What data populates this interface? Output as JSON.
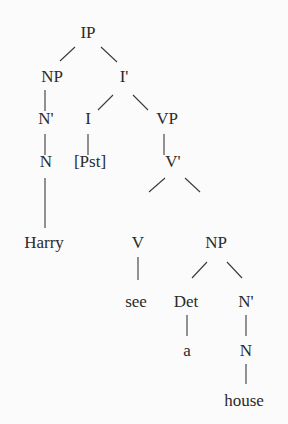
{
  "nodes": {
    "ip": {
      "label": "IP",
      "x": 88,
      "y": 38
    },
    "np1": {
      "label": "NP",
      "x": 52,
      "y": 82
    },
    "ibar": {
      "label": "I'",
      "x": 124,
      "y": 82
    },
    "nbar1": {
      "label": "N'",
      "x": 46,
      "y": 124
    },
    "i": {
      "label": "I",
      "x": 88,
      "y": 124
    },
    "vp": {
      "label": "VP",
      "x": 167,
      "y": 124
    },
    "n1": {
      "label": "N",
      "x": 46,
      "y": 167
    },
    "pst": {
      "label": "[Pst]",
      "x": 90,
      "y": 167
    },
    "vbar": {
      "label": "V'",
      "x": 173,
      "y": 167
    },
    "harry": {
      "label": "Harry",
      "x": 44,
      "y": 248
    },
    "v": {
      "label": "V",
      "x": 138,
      "y": 248
    },
    "np2": {
      "label": "NP",
      "x": 216,
      "y": 248
    },
    "see": {
      "label": "see",
      "x": 136,
      "y": 307
    },
    "det": {
      "label": "Det",
      "x": 186,
      "y": 307
    },
    "nbar2": {
      "label": "N'",
      "x": 246,
      "y": 307
    },
    "a": {
      "label": "a",
      "x": 187,
      "y": 356
    },
    "n2": {
      "label": "N",
      "x": 246,
      "y": 356
    },
    "house": {
      "label": "house",
      "x": 244,
      "y": 406
    }
  },
  "edges": [
    [
      "ip",
      "np1"
    ],
    [
      "ip",
      "ibar"
    ],
    [
      "np1",
      "nbar1"
    ],
    [
      "ibar",
      "i"
    ],
    [
      "ibar",
      "vp"
    ],
    [
      "nbar1",
      "n1"
    ],
    [
      "i",
      "pst"
    ],
    [
      "vp",
      "vbar"
    ],
    [
      "n1",
      "harry"
    ],
    [
      "vbar",
      "v"
    ],
    [
      "vbar",
      "np2"
    ],
    [
      "v",
      "see"
    ],
    [
      "np2",
      "det"
    ],
    [
      "np2",
      "nbar2"
    ],
    [
      "det",
      "a"
    ],
    [
      "nbar2",
      "n2"
    ],
    [
      "n2",
      "house"
    ]
  ]
}
